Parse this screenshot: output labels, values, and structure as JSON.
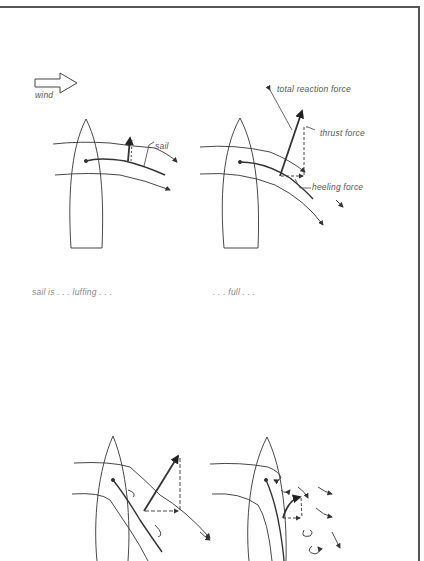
{
  "legend": {
    "wind_label": "wind"
  },
  "diagrams": [
    {
      "id": "luffing",
      "caption": "sail is . . . luffing . . .",
      "labels": {
        "sail": "sail"
      }
    },
    {
      "id": "full",
      "caption": ". . . full . . .",
      "labels": {
        "total_reaction_force": "total reaction force",
        "thrust_force": "thrust force",
        "heeling_force": "heeling force"
      }
    },
    {
      "id": "over-trimmed",
      "caption": ""
    },
    {
      "id": "stalled",
      "caption": ""
    }
  ],
  "colors": {
    "ink": "#333333",
    "label": "#555555",
    "frame": "#555555"
  }
}
